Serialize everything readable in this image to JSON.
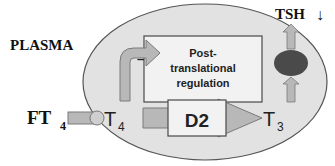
{
  "diagram": {
    "compartment_label": "PLASMA",
    "input_label": "FT",
    "input_subscript": "4",
    "substrate_label": "T",
    "substrate_subscript": "4",
    "product_label": "T",
    "product_subscript": "3",
    "enzyme_label": "D2",
    "regulation_box": {
      "line1": "Post-",
      "line2": "translational",
      "line3": "regulation"
    },
    "inhibition_sign": "–",
    "output_label": "TSH",
    "output_direction_glyph": "↓",
    "colors": {
      "ellipse_fill": "#e2e2e2",
      "ellipse_stroke": "#555555",
      "arrow_fill": "#b8b8b8",
      "arrow_stroke": "#7a7a7a",
      "box_fill": "#f2f2f2",
      "box_stroke": "#555555",
      "cell_fill": "#4a4a4a"
    }
  }
}
